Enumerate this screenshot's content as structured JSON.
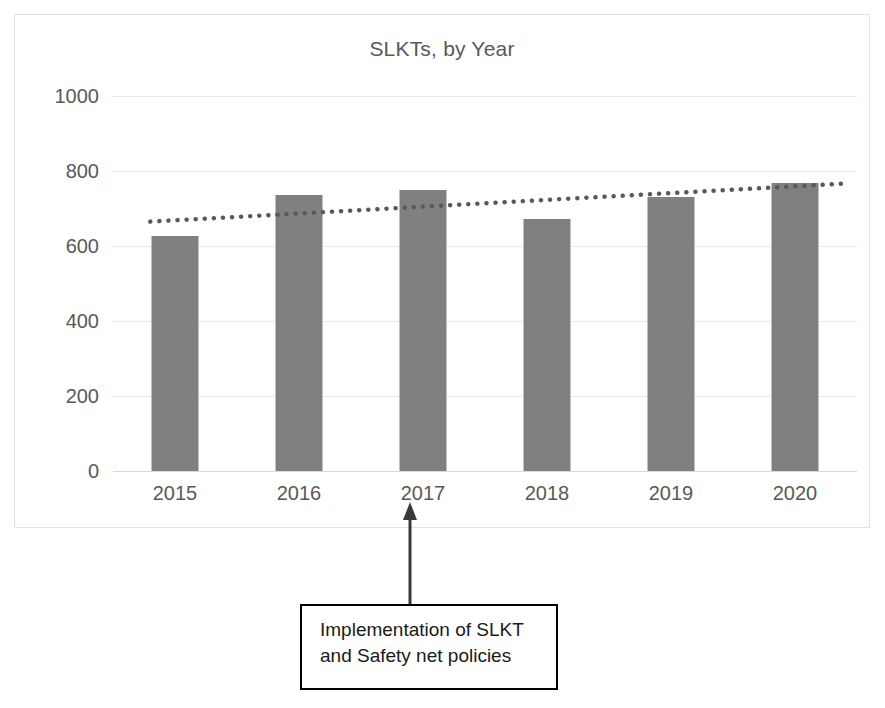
{
  "chart_data": {
    "type": "bar",
    "title": "SLKTs, by Year",
    "xlabel": "",
    "ylabel": "",
    "categories": [
      "2015",
      "2016",
      "2017",
      "2018",
      "2019",
      "2020"
    ],
    "values": [
      627,
      735,
      750,
      672,
      730,
      768
    ],
    "series": [
      {
        "name": "SLKTs",
        "values": [
          627,
          735,
          750,
          672,
          730,
          768
        ]
      }
    ],
    "ylim": [
      0,
      1000
    ],
    "yticks": [
      1000,
      800,
      600,
      400,
      200,
      0
    ],
    "ytick_labels": [
      "1000",
      "800",
      "600",
      "400",
      "200",
      "0"
    ],
    "xtick_labels": [
      "2015",
      "2016",
      "2017",
      "2018",
      "2019",
      "2020"
    ],
    "grid": true,
    "legend": false,
    "legend_position": "none",
    "bar_color": "#808080",
    "gridline_color": "#e8e8e8",
    "text_color": "#595959",
    "trendline": {
      "type": "linear",
      "style": "dotted",
      "color": "#595959",
      "start_value": 665,
      "end_value": 766
    },
    "annotations": [
      {
        "text": "Implementation of SLKT\nand Safety net policies",
        "points_to_category": "2017",
        "arrow": "up",
        "border_color": "#000000"
      }
    ]
  }
}
